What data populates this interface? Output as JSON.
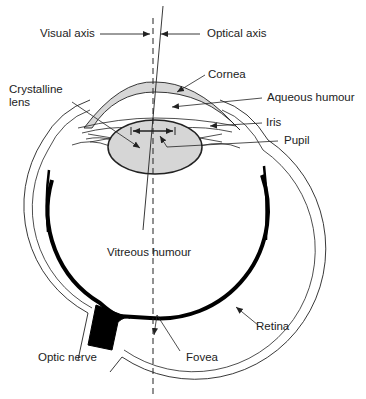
{
  "diagram": {
    "labels": {
      "visual_axis": "Visual axis",
      "optical_axis": "Optical axis",
      "cornea": "Cornea",
      "crystalline_lens_line1": "Crystalline",
      "crystalline_lens_line2": "lens",
      "aqueous_humour": "Aqueous humour",
      "iris": "Iris",
      "pupil": "Pupil",
      "vitreous_humour": "Vitreous humour",
      "retina": "Retina",
      "optic_nerve": "Optic nerve",
      "fovea": "Fovea"
    },
    "colors": {
      "line": "#222222",
      "fill_gray": "#d6d6d6",
      "retina": "#000000",
      "background": "#ffffff"
    }
  }
}
